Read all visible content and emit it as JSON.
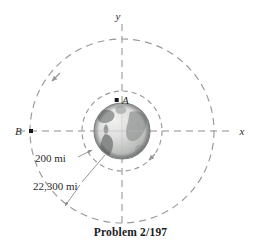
{
  "figure": {
    "caption": "Problem 2/197",
    "axes": {
      "y_label": "y",
      "x_label": "x"
    },
    "points": [
      {
        "id": "A",
        "label": "A",
        "cx": 117,
        "cy": 100,
        "on": "inner-orbit"
      },
      {
        "id": "B",
        "label": "B",
        "cx": 31,
        "cy": 131,
        "on": "outer-orbit"
      }
    ],
    "dimensions": [
      {
        "id": "inner-altitude",
        "label": "200 mi",
        "x": 40,
        "y": 160
      },
      {
        "id": "outer-altitude",
        "label": "22,300 mi",
        "x": 37,
        "y": 189
      }
    ],
    "body": {
      "name": "earth",
      "cx": 122,
      "cy": 131,
      "r": 28
    },
    "orbits": [
      {
        "id": "inner-orbit",
        "cx": 122,
        "cy": 131,
        "r": 40,
        "dash": "5 4"
      },
      {
        "id": "outer-orbit",
        "cx": 122,
        "cy": 131,
        "r": 92,
        "dash": "7 5"
      }
    ],
    "colors": {
      "orbit": "#9a9a9a",
      "axis": "#8d8d8d",
      "leader": "#9a9a9a",
      "marker": "#161616",
      "text": "#2b2b2b",
      "caption": "#1c1c1c",
      "background": "#ffffff",
      "globe_ocean": "#d9dada",
      "globe_land": "#8e9290",
      "globe_edge": "#7d8180"
    }
  }
}
